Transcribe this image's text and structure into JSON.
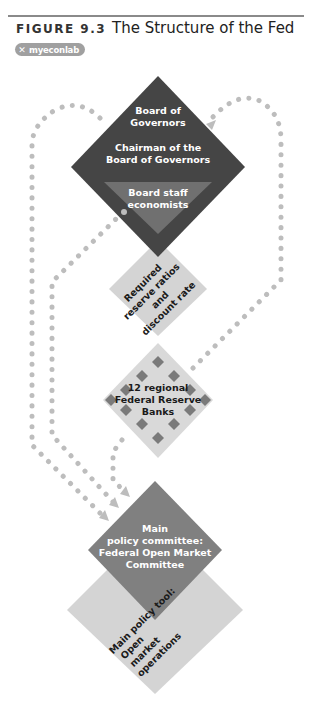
{
  "header": {
    "figure_number": "FIGURE 9.3",
    "title": "The Structure of the Fed",
    "badge": {
      "icon": "x-icon",
      "label": "myeconlab"
    }
  },
  "diagram": {
    "board": {
      "line1": "Board of",
      "line2": "Governors",
      "line3": "Chairman of the",
      "line4": "Board of Governors"
    },
    "staff": {
      "line1": "Board staff",
      "line2": "economists"
    },
    "tools_1": {
      "line1": "Required",
      "line2": "reserve ratios",
      "line3": "and",
      "line4": "discount rate"
    },
    "banks": {
      "line1": "12 regional",
      "line2": "Federal Reserve",
      "line3": "Banks"
    },
    "fomc": {
      "line1": "Main",
      "line2": "policy committee:",
      "line3": "Federal Open Market",
      "line4": "Committee"
    },
    "tools_2": {
      "line1": "Main policy tool:",
      "line2": "Open",
      "line3": "market",
      "line4": "operations"
    }
  },
  "colors": {
    "board": "#454545",
    "staff": "#707070",
    "light": "#d4d4d4",
    "banks": "#d9d9d9",
    "bank_marker": "#7a7a7a",
    "fomc": "#808080",
    "dots": "#bdbdbd"
  }
}
